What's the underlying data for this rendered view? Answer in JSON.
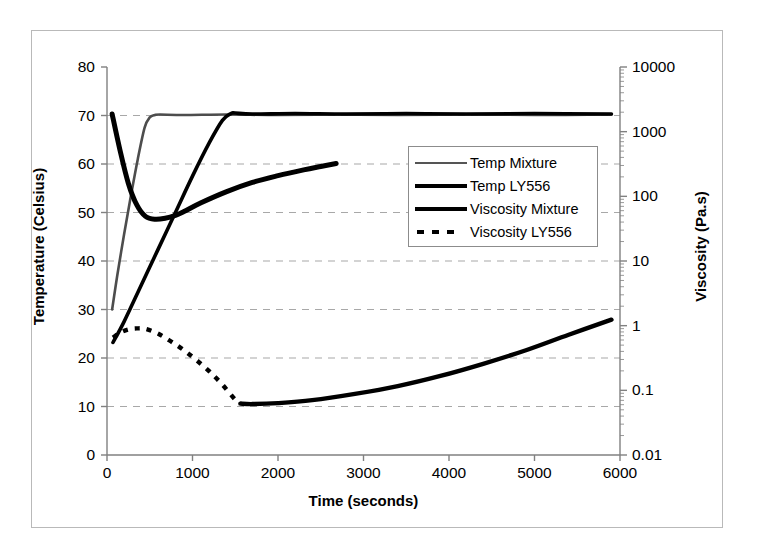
{
  "chart_data": {
    "type": "line",
    "title": "",
    "xlabel": "Time (seconds)",
    "ylabel": "Temperature (Celsius)",
    "y2label": "Viscosity (Pa.s)",
    "xlim": [
      0,
      6000
    ],
    "ylim": [
      0,
      80
    ],
    "y2lim": [
      0.01,
      10000
    ],
    "y2scale": "log",
    "grid": "horizontal-dashed",
    "legend_position": "center-right-inside",
    "x_ticks": [
      "0",
      "1000",
      "2000",
      "3000",
      "4000",
      "5000",
      "6000"
    ],
    "x_tick_values": [
      0,
      1000,
      2000,
      3000,
      4000,
      5000,
      6000
    ],
    "y_ticks": [
      "0",
      "10",
      "20",
      "30",
      "40",
      "50",
      "60",
      "70",
      "80"
    ],
    "y_tick_values": [
      0,
      10,
      20,
      30,
      40,
      50,
      60,
      70,
      80
    ],
    "y2_ticks": [
      "0.01",
      "0.1",
      "1",
      "10",
      "100",
      "1000",
      "10000"
    ],
    "y2_tick_values": [
      0.01,
      0.1,
      1,
      10,
      100,
      1000,
      10000
    ],
    "series": [
      {
        "name": "Temp Mixture",
        "axis": "left",
        "units": "Celsius",
        "style": "solid-thin",
        "color": "#4d4d4d",
        "x": [
          60,
          120,
          200,
          280,
          360,
          440,
          500,
          560,
          620,
          900,
          1400,
          2000,
          2700,
          3400,
          4200,
          5000,
          5900
        ],
        "y": [
          30.0,
          37.0,
          45.5,
          53.5,
          61.0,
          67.5,
          69.6,
          70.1,
          70.2,
          70.1,
          70.2,
          70.1,
          70.2,
          70.1,
          70.2,
          70.1,
          70.2
        ]
      },
      {
        "name": "Temp LY556",
        "axis": "left",
        "units": "Celsius",
        "style": "solid-medium",
        "color": "#000000",
        "x": [
          70,
          200,
          400,
          600,
          800,
          1000,
          1200,
          1350,
          1450,
          1500,
          1700,
          2200,
          2800,
          3500,
          4200,
          5000,
          5900
        ],
        "y": [
          23.2,
          27.5,
          35.0,
          42.5,
          50.0,
          57.5,
          64.5,
          69.0,
          70.4,
          70.5,
          70.3,
          70.4,
          70.3,
          70.4,
          70.3,
          70.4,
          70.3
        ]
      },
      {
        "name": "Viscosity Mixture",
        "axis": "right",
        "units": "Pa.s",
        "style": "solid-thick",
        "color": "#000000",
        "x": [
          60,
          150,
          250,
          350,
          450,
          560,
          680,
          800,
          900,
          1100,
          1400,
          1700,
          2000,
          2300,
          2500,
          2680
        ],
        "y_temp_scale": [
          70.3,
          63.0,
          56.0,
          51.5,
          49.2,
          48.6,
          48.8,
          49.4,
          50.2,
          52.0,
          54.3,
          56.2,
          57.6,
          58.8,
          59.5,
          60.1
        ],
        "y": [
          1700,
          480,
          160,
          78,
          53,
          47,
          49,
          56,
          65,
          90,
          130,
          175,
          210,
          250,
          280,
          310
        ]
      },
      {
        "name": "Viscosity LY556",
        "axis": "right",
        "units": "Pa.s",
        "style": "dotted-then-solid",
        "color": "#000000",
        "dotted_until_x": 1560,
        "x": [
          70,
          150,
          250,
          350,
          450,
          600,
          750,
          900,
          1050,
          1200,
          1350,
          1500,
          1560,
          1700,
          2000,
          2400,
          2900,
          3400,
          3900,
          4400,
          4900,
          5400,
          5900
        ],
        "y_temp_scale": [
          24.2,
          25.2,
          25.9,
          26.1,
          26.0,
          25.0,
          23.4,
          21.6,
          19.5,
          17.2,
          14.5,
          11.4,
          10.6,
          10.5,
          10.7,
          11.3,
          12.6,
          14.2,
          16.3,
          18.8,
          21.6,
          24.8,
          27.9
        ],
        "y": [
          0.56,
          0.7,
          0.82,
          0.85,
          0.83,
          0.68,
          0.52,
          0.39,
          0.29,
          0.22,
          0.15,
          0.085,
          0.068,
          0.066,
          0.07,
          0.08,
          0.098,
          0.125,
          0.165,
          0.225,
          0.315,
          0.46,
          0.7
        ]
      }
    ]
  },
  "axes": {
    "x_title": "Time (seconds)",
    "y_left_title": "Temperature (Celsius)",
    "y_right_title": "Viscosity (Pa.s)"
  },
  "legend": {
    "items": [
      {
        "label": "Temp Mixture",
        "style": "sw-thin"
      },
      {
        "label": "Temp LY556",
        "style": "sw-med"
      },
      {
        "label": "Viscosity Mixture",
        "style": "sw-thick"
      },
      {
        "label": "Viscosity LY556",
        "style": "sw-dotted"
      }
    ]
  },
  "colors": {
    "frame_border": "#b9b9b9",
    "axis_line": "#808080",
    "gridline": "#a8a8a8",
    "series_dark": "#000000",
    "series_grey": "#4d4d4d",
    "background": "#ffffff"
  }
}
